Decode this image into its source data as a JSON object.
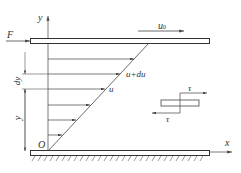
{
  "diagram": {
    "labels": {
      "y_axis": "y",
      "x_axis": "x",
      "origin": "O",
      "force": "F",
      "plate_velocity": "u",
      "plate_velocity_sub": "0",
      "velocity_upper": "u+du",
      "velocity": "u",
      "dy": "dy",
      "y_height": "y",
      "tau_top": "τ",
      "tau_bottom": "τ"
    },
    "colors": {
      "line": "#444444",
      "background": "#ffffff"
    },
    "velocity_arrows_y": [
      59,
      74,
      89,
      105,
      120,
      135
    ]
  }
}
